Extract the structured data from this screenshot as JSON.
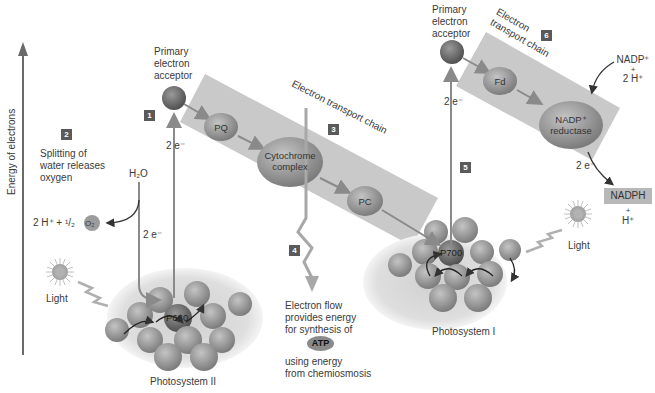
{
  "diagram": {
    "type": "photosynthesis-light-reactions",
    "y_axis_label": "Energy of electrons",
    "colors": {
      "etc_band": "#c9c9c9",
      "carrier_oval": "#8f8f8f",
      "acceptor_sphere": "#6e6e6e",
      "photosystem_halo": "#dcdcdc",
      "pigment_sphere": "#9a9a9a",
      "arrow": "#8a8a8a",
      "badge": "#5a5a5a"
    },
    "steps": [
      {
        "number": "1"
      },
      {
        "number": "2",
        "text": [
          "Splitting of",
          "water releases",
          "oxygen"
        ]
      },
      {
        "number": "3",
        "text": "Electron transport chain"
      },
      {
        "number": "4",
        "text": [
          "Electron flow",
          "provides energy",
          "for synthesis of"
        ],
        "molecule": "ATP",
        "text_after": [
          "using energy",
          "from chemiosmosis"
        ]
      },
      {
        "number": "5"
      },
      {
        "number": "6",
        "text": [
          "Electron",
          "transport chain"
        ]
      }
    ],
    "photosystem_ii": {
      "label": "Photosystem II",
      "reaction_center": "P680",
      "light_label": "Light",
      "acceptor_label": [
        "Primary",
        "electron",
        "acceptor"
      ],
      "electron_label": "2 e⁻",
      "water": "H₂O",
      "water_products": [
        "2 H⁺ + ¹/₂",
        "O₂"
      ]
    },
    "etc1": {
      "carriers": [
        "PQ",
        "Cytochrome complex",
        "PC"
      ]
    },
    "photosystem_i": {
      "label": "Photosystem I",
      "reaction_center": "P700",
      "light_label": "Light",
      "acceptor_label": [
        "Primary",
        "electron",
        "acceptor"
      ],
      "electron_label": "2 e⁻"
    },
    "etc2": {
      "carriers": [
        "Fd",
        "NADP⁺ reductase"
      ],
      "input": [
        "NADP⁺",
        "+",
        "2 H⁺"
      ],
      "electron_label": "2 e⁻",
      "output": "NADPH",
      "output_extra": [
        "+",
        "H⁺"
      ]
    }
  }
}
